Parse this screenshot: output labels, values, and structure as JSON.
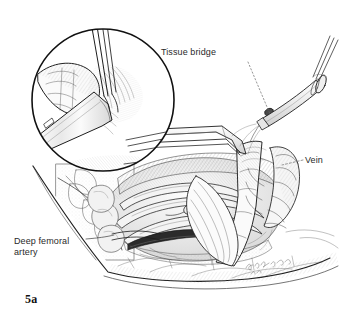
{
  "figure": {
    "caption": "5a",
    "kind": "surgical-line-illustration",
    "background_color": "#ffffff",
    "ink_color": "#1a1a1a",
    "label_color": "#2a2a2a",
    "shading_color": "#8d8d8d"
  },
  "labels": {
    "tissue_bridge": "Tissue bridge",
    "vein": "Vein",
    "deep_femoral_artery": "Deep femoral\nartery"
  },
  "leader_lines": [
    {
      "name": "tissue-bridge-leader",
      "style": "dotted",
      "from": [
        248,
        62
      ],
      "to": [
        268,
        112
      ]
    },
    {
      "name": "vein-leader",
      "style": "dashed",
      "from": [
        303,
        160
      ],
      "to": [
        282,
        166
      ]
    },
    {
      "name": "deep-femoral-artery-leader",
      "style": "solid",
      "from": [
        87,
        240
      ],
      "to": [
        112,
        236
      ]
    }
  ],
  "inset": {
    "name": "magnified-inset-circle",
    "center": [
      103,
      100
    ],
    "radius": 72,
    "stroke_color": "#111111",
    "contents": "Magnified view: forceps grasping tissue bridge with dissecting instrument beneath"
  },
  "instruments": [
    {
      "name": "forceps-upper",
      "description": "Fine forceps entering from top of inset"
    },
    {
      "name": "dissector-inset",
      "description": "Angled dissector blade in lower left of inset"
    },
    {
      "name": "retractor-blade-horizontal",
      "description": "Long angled retractor crossing the wound"
    },
    {
      "name": "retractor-handle-right",
      "description": "Retractor handle with cylindrical grip at upper right"
    }
  ],
  "anatomy": [
    {
      "name": "deep-femoral-artery",
      "region": "lower-left of wound"
    },
    {
      "name": "vein",
      "region": "right of wound"
    },
    {
      "name": "tissue-bridge",
      "region": "center, elevated by retractor"
    },
    {
      "name": "skin-flap",
      "region": "wound margin, bottom"
    }
  ],
  "signature": {
    "name": "artist-signature",
    "text": ""
  }
}
